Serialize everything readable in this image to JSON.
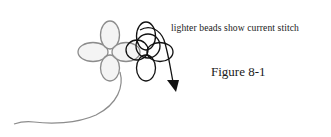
{
  "figure": {
    "label": "Figure 8-1",
    "note": "lighter beads show current stitch"
  },
  "colors": {
    "light_bead_stroke": "#8c8c8c",
    "light_bead_fill": "#ececec",
    "dark_bead_stroke": "#111111",
    "thread": "#8c8c8c",
    "arrow": "#111111",
    "text": "#1a1a1a"
  },
  "beads": {
    "light_group": [
      "top",
      "left",
      "right",
      "bottom"
    ],
    "dark_group": [
      "top",
      "left",
      "right",
      "bottom"
    ]
  }
}
